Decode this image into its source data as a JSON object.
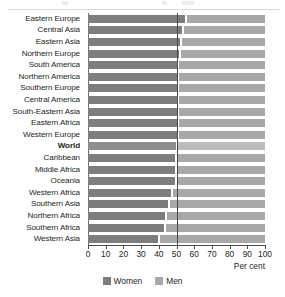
{
  "colors": {
    "women": "#7d7d7d",
    "men": "#a8a8a8",
    "reference_line": "#4a4a4a",
    "text": "#231f20",
    "background": "#ffffff"
  },
  "axis": {
    "caption": "Per cent",
    "ticks": [
      "0",
      "10",
      "20",
      "30",
      "40",
      "50",
      "60",
      "70",
      "80",
      "90",
      "100"
    ]
  },
  "legend": {
    "women_label": "Women",
    "men_label": "Men"
  },
  "chart_data": {
    "type": "bar",
    "orientation": "horizontal",
    "stacked": true,
    "stacked_total": 100,
    "title": "",
    "subtitle": "",
    "xlabel": "Per cent",
    "ylabel": "",
    "xlim": [
      0,
      100
    ],
    "xticks": [
      0,
      10,
      20,
      30,
      40,
      50,
      60,
      70,
      80,
      90,
      100
    ],
    "grid": false,
    "legend_position": "bottom-center",
    "reference_lines": [
      50
    ],
    "highlight_category": "World",
    "categories": [
      "Eastern Europe",
      "Central Asia",
      "Eastern Asia",
      "Northern Europe",
      "South America",
      "Northern America",
      "Southern Europe",
      "Central America",
      "South-Eastern Asia",
      "Eastern Africa",
      "Western Europe",
      "World",
      "Caribbean",
      "Middle Africa",
      "Oceania",
      "Western Africa",
      "Southern Asia",
      "Northern Africa",
      "Southern Africa",
      "Western Asia"
    ],
    "series": [
      {
        "name": "Women",
        "values": [
          55,
          53,
          52,
          51.5,
          50.5,
          50.5,
          50.5,
          50.5,
          50,
          50,
          50,
          49.5,
          49,
          49,
          49,
          47,
          45,
          43.5,
          43,
          39.5
        ]
      },
      {
        "name": "Men",
        "values": [
          45,
          47,
          48,
          48.5,
          49.5,
          49.5,
          49.5,
          49.5,
          50,
          50,
          50,
          50.5,
          51,
          51,
          51,
          53,
          55,
          56.5,
          57,
          60.5
        ]
      }
    ]
  }
}
